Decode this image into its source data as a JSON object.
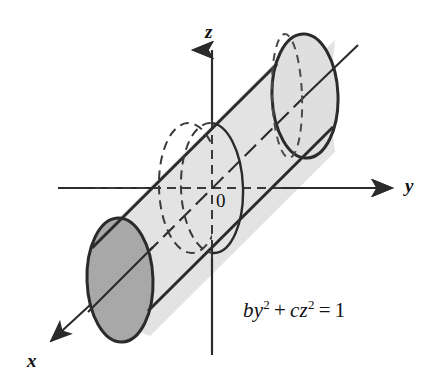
{
  "figure": {
    "equation": {
      "full": "by2 + cz2 = 1",
      "term1_base": "by",
      "term1_exp": "2",
      "operator_plus": "+",
      "term2_base": "cz",
      "term2_exp": "2",
      "operator_equals": "=",
      "right_side": "1"
    },
    "axes": [
      {
        "name": "z-axis",
        "label": "z",
        "direction": "up"
      },
      {
        "name": "y-axis",
        "label": "y",
        "direction": "right"
      },
      {
        "name": "x-axis",
        "label": "x",
        "direction": "down-left"
      }
    ],
    "origin_label": "0",
    "colors": {
      "stroke": "#2b2b2b",
      "body_fill": "#e3e3e3",
      "far_cap_fill": "#dddddd",
      "near_cap_fill": "#a8a8a8",
      "background": "#ffffff",
      "text": "#111111"
    },
    "geometry": {
      "origin": {
        "x": 212,
        "y": 188
      },
      "middle_ellipse": {
        "cx": 212,
        "cy": 188,
        "rx": 31,
        "ry": 65,
        "tilt_deg": -2
      },
      "far_cap": {
        "cx": 305,
        "cy": 96,
        "rx": 33,
        "ry": 62,
        "tilt_deg": -2
      },
      "near_cap": {
        "cx": 120,
        "cy": 280,
        "rx": 33,
        "ry": 62,
        "tilt_deg": -2
      },
      "axis_line_start": {
        "x": 47,
        "y": 345
      },
      "axis_line_end": {
        "x": 358,
        "y": 45
      }
    }
  }
}
